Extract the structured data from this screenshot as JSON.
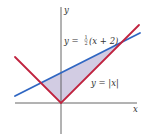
{
  "diagram": {
    "type": "function-graph",
    "axes": {
      "x_label": "x",
      "y_label": "y",
      "color": "#555555"
    },
    "curves": [
      {
        "name": "line",
        "equation": "y = 1/2(x + 2)",
        "label_prefix": "y = ",
        "label_frac_num": "1",
        "label_frac_den": "2",
        "label_suffix": "(x + 2)",
        "color": "#2f66c2"
      },
      {
        "name": "absolute-value",
        "equation": "y = |x|",
        "label": "y = |x|",
        "color": "#c0233f"
      }
    ],
    "shaded_region": {
      "description": "Region between curves from x = -2/3 to x = 2",
      "color": "#cdc6e0",
      "intersections": [
        {
          "x": "-2/3",
          "y": "2/3"
        },
        {
          "x": "2",
          "y": "2"
        }
      ]
    }
  }
}
